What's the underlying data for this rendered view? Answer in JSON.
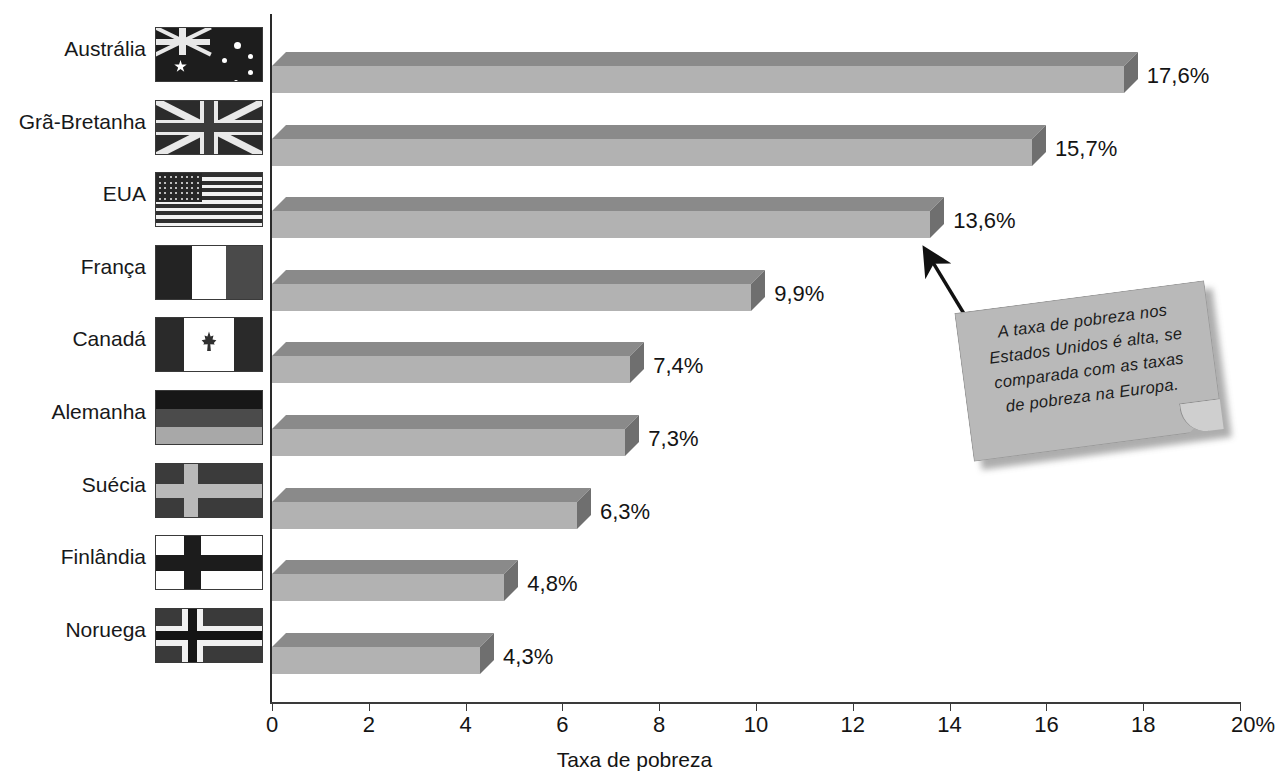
{
  "page": {
    "top_cropped_text": "",
    "background_color": "#ffffff"
  },
  "axis": {
    "x_title": "Taxa de pobreza",
    "tick_labels": [
      "0",
      "2",
      "4",
      "6",
      "8",
      "10",
      "12",
      "14",
      "16",
      "18",
      "20%"
    ]
  },
  "callout": {
    "text": "A taxa de pobreza nos Estados Unidos é alta, se comparada com as taxas de pobreza na Europa.",
    "lines": [
      "A taxa de pobreza nos",
      "Estados Unidos é alta, se",
      "comparada com as taxas",
      "de pobreza na Europa."
    ],
    "points_at": "EUA",
    "fill_color": "#b9b9b9",
    "arrow_color": "#111111"
  },
  "rows": [
    {
      "country": "Austrália",
      "flag": "flag-australia",
      "value": 17.6,
      "value_label": "17,6%"
    },
    {
      "country": "Grã-Bretanha",
      "flag": "flag-united-kingdom",
      "value": 15.7,
      "value_label": "15,7%"
    },
    {
      "country": "EUA",
      "flag": "flag-united-states",
      "value": 13.6,
      "value_label": "13,6%"
    },
    {
      "country": "França",
      "flag": "flag-france",
      "value": 9.9,
      "value_label": "9,9%"
    },
    {
      "country": "Canadá",
      "flag": "flag-canada",
      "value": 7.4,
      "value_label": "7,4%"
    },
    {
      "country": "Alemanha",
      "flag": "flag-germany",
      "value": 7.3,
      "value_label": "7,3%"
    },
    {
      "country": "Suécia",
      "flag": "flag-sweden",
      "value": 6.3,
      "value_label": "6,3%"
    },
    {
      "country": "Finlândia",
      "flag": "flag-finland",
      "value": 4.8,
      "value_label": "4,8%"
    },
    {
      "country": "Noruega",
      "flag": "flag-norway",
      "value": 4.3,
      "value_label": "4,3%"
    }
  ],
  "chart_data": {
    "type": "bar",
    "orientation": "horizontal",
    "style": "3d",
    "title": "",
    "subtitle": "",
    "xlabel": "Taxa de pobreza",
    "ylabel": "",
    "xlim": [
      0,
      20
    ],
    "xticks": [
      0,
      2,
      4,
      6,
      8,
      10,
      12,
      14,
      16,
      18,
      20
    ],
    "xtick_labels": [
      "0",
      "2",
      "4",
      "6",
      "8",
      "10",
      "12",
      "14",
      "16",
      "18",
      "20%"
    ],
    "unit": "%",
    "grid": false,
    "legend": false,
    "decimal_separator": ",",
    "categories": [
      "Austrália",
      "Grã-Bretanha",
      "EUA",
      "França",
      "Canadá",
      "Alemanha",
      "Suécia",
      "Finlândia",
      "Noruega"
    ],
    "values": [
      17.6,
      15.7,
      13.6,
      9.9,
      7.4,
      7.3,
      6.3,
      4.8,
      4.3
    ],
    "value_labels": [
      "17,6%",
      "15,7%",
      "13,6%",
      "9,9%",
      "7,4%",
      "7,3%",
      "6,3%",
      "4,8%",
      "4,3%"
    ],
    "bar_colors": {
      "front": "#b2b2b2",
      "top": "#8a8a8a",
      "side": "#6f6f6f"
    },
    "annotations": [
      {
        "text": "A taxa de pobreza nos Estados Unidos é alta, se comparada com as taxas de pobreza na Europa.",
        "target_category": "EUA",
        "shape": "sticky-note"
      }
    ]
  }
}
